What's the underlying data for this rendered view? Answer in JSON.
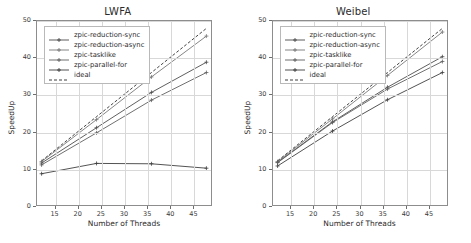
{
  "figure": {
    "background": "#ffffff",
    "panels": [
      "lwfa",
      "weibel"
    ]
  },
  "lwfa": {
    "title": "LWFA",
    "xlabel": "Number of Threads",
    "ylabel": "SpeedUp",
    "xticks": [
      "15",
      "20",
      "25",
      "30",
      "35",
      "40",
      "45"
    ],
    "yticks": [
      "0",
      "10",
      "20",
      "30",
      "40",
      "50"
    ],
    "legend": [
      "zpic-reduction-sync",
      "zpic-reduction-async",
      "zpic-tasklike",
      "zpic-parallel-for",
      "ideal"
    ]
  },
  "weibel": {
    "title": "Weibel",
    "xlabel": "Number of Threads",
    "ylabel": "SpeedUp",
    "xticks": [
      "15",
      "20",
      "25",
      "30",
      "35",
      "40",
      "45"
    ],
    "yticks": [
      "0",
      "10",
      "20",
      "30",
      "40",
      "50"
    ],
    "legend": [
      "zpic-reduction-sync",
      "zpic-reduction-async",
      "zpic-tasklike",
      "zpic-parallel-for",
      "ideal"
    ]
  },
  "chart_data": [
    {
      "type": "line",
      "title": "LWFA",
      "xlabel": "Number of Threads",
      "ylabel": "SpeedUp",
      "xlim": [
        11,
        49
      ],
      "ylim": [
        0,
        50
      ],
      "xticks": [
        15,
        20,
        25,
        30,
        35,
        40,
        45
      ],
      "yticks": [
        0,
        10,
        20,
        30,
        40,
        50
      ],
      "grid": true,
      "legend_position": "upper left",
      "x": [
        12,
        24,
        36,
        48
      ],
      "series": [
        {
          "name": "zpic-reduction-sync",
          "color": "#4a4a4a",
          "linestyle": "solid",
          "marker": "plus",
          "values": [
            11.4,
            21.0,
            30.6,
            38.8
          ]
        },
        {
          "name": "zpic-reduction-async",
          "color": "#777777",
          "linestyle": "solid",
          "marker": "plus",
          "values": [
            11.8,
            23.2,
            34.8,
            45.9
          ]
        },
        {
          "name": "zpic-tasklike",
          "color": "#5e5e5e",
          "linestyle": "solid",
          "marker": "plus",
          "values": [
            10.9,
            19.6,
            28.5,
            36.0
          ]
        },
        {
          "name": "zpic-parallel-for",
          "color": "#3d3d3d",
          "linestyle": "solid",
          "marker": "plus",
          "values": [
            8.5,
            11.3,
            11.2,
            10.0
          ]
        },
        {
          "name": "ideal",
          "color": "#2b2b2b",
          "linestyle": "dashed",
          "marker": "none",
          "values": [
            12.0,
            24.0,
            36.0,
            48.0
          ]
        }
      ]
    },
    {
      "type": "line",
      "title": "Weibel",
      "xlabel": "Number of Threads",
      "ylabel": "SpeedUp",
      "xlim": [
        11,
        49
      ],
      "ylim": [
        0,
        50
      ],
      "xticks": [
        15,
        20,
        25,
        30,
        35,
        40,
        45
      ],
      "yticks": [
        0,
        10,
        20,
        30,
        40,
        50
      ],
      "grid": true,
      "legend_position": "upper left",
      "x": [
        12,
        24,
        36,
        48
      ],
      "series": [
        {
          "name": "zpic-reduction-sync",
          "color": "#4a4a4a",
          "linestyle": "solid",
          "marker": "plus",
          "values": [
            11.6,
            22.6,
            32.0,
            40.3
          ]
        },
        {
          "name": "zpic-reduction-async",
          "color": "#777777",
          "linestyle": "solid",
          "marker": "plus",
          "values": [
            11.8,
            23.4,
            35.2,
            47.0
          ]
        },
        {
          "name": "zpic-tasklike",
          "color": "#5e5e5e",
          "linestyle": "solid",
          "marker": "plus",
          "values": [
            11.5,
            22.4,
            31.5,
            39.0
          ]
        },
        {
          "name": "zpic-parallel-for",
          "color": "#3d3d3d",
          "linestyle": "solid",
          "marker": "plus",
          "values": [
            10.6,
            20.1,
            28.6,
            36.0
          ]
        },
        {
          "name": "ideal",
          "color": "#2b2b2b",
          "linestyle": "dashed",
          "marker": "none",
          "values": [
            12.0,
            24.0,
            36.0,
            48.0
          ]
        }
      ]
    }
  ]
}
